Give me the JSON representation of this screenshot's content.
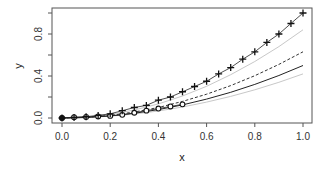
{
  "chart_data": {
    "type": "line",
    "title": "",
    "xlabel": "x",
    "ylabel": "y",
    "xlim": [
      0.0,
      1.0
    ],
    "ylim": [
      0.0,
      1.0
    ],
    "grid": false,
    "legend": null,
    "x_ticks": [
      0.0,
      0.2,
      0.4,
      0.6,
      0.8,
      1.0
    ],
    "x_tick_labels": [
      "0.0",
      "0.2",
      "0.4",
      "0.6",
      "0.8",
      "1.0"
    ],
    "y_ticks": [
      0.0,
      0.2,
      0.4,
      0.6,
      0.8,
      1.0
    ],
    "y_tick_labels": [
      "0.0",
      "",
      "0.4",
      "",
      "0.8",
      ""
    ],
    "series": [
      {
        "name": "plus-points",
        "style": "markers+line",
        "marker": "plus",
        "color": "#222222",
        "x": [
          0.0,
          0.05,
          0.1,
          0.15,
          0.2,
          0.25,
          0.3,
          0.35,
          0.4,
          0.45,
          0.5,
          0.55,
          0.6,
          0.65,
          0.7,
          0.75,
          0.8,
          0.85,
          0.9,
          0.95,
          1.0
        ],
        "y": [
          0.0,
          0.005,
          0.012,
          0.025,
          0.04,
          0.07,
          0.1,
          0.12,
          0.17,
          0.2,
          0.25,
          0.3,
          0.35,
          0.42,
          0.48,
          0.56,
          0.63,
          0.72,
          0.8,
          0.9,
          1.0
        ]
      },
      {
        "name": "circle-points",
        "style": "markers+line",
        "marker": "circle",
        "color": "#222222",
        "x": [
          0.0,
          0.05,
          0.1,
          0.15,
          0.2,
          0.25,
          0.3,
          0.35,
          0.4,
          0.45,
          0.5
        ],
        "y": [
          0.0,
          0.008,
          0.01,
          0.015,
          0.02,
          0.03,
          0.05,
          0.07,
          0.09,
          0.11,
          0.13
        ]
      },
      {
        "name": "solid-fit",
        "style": "solid",
        "color": "#222222",
        "x": [
          0.0,
          0.1,
          0.2,
          0.3,
          0.4,
          0.5,
          0.6,
          0.7,
          0.8,
          0.9,
          1.0
        ],
        "y": [
          0.0,
          0.005,
          0.02,
          0.045,
          0.08,
          0.125,
          0.18,
          0.245,
          0.32,
          0.405,
          0.5
        ]
      },
      {
        "name": "dashed-fit",
        "style": "dashed",
        "color": "#333333",
        "x": [
          0.0,
          0.1,
          0.2,
          0.3,
          0.4,
          0.5,
          0.6,
          0.7,
          0.8,
          0.9,
          1.0
        ],
        "y": [
          0.0,
          0.006,
          0.025,
          0.057,
          0.1,
          0.158,
          0.227,
          0.309,
          0.403,
          0.51,
          0.63
        ]
      },
      {
        "name": "upper-band",
        "style": "solid",
        "color": "#c8c8c8",
        "x": [
          0.0,
          0.1,
          0.2,
          0.3,
          0.4,
          0.5,
          0.6,
          0.7,
          0.8,
          0.9,
          1.0
        ],
        "y": [
          0.0,
          0.008,
          0.034,
          0.076,
          0.134,
          0.21,
          0.302,
          0.412,
          0.538,
          0.68,
          0.84
        ]
      },
      {
        "name": "lower-band",
        "style": "solid",
        "color": "#c8c8c8",
        "x": [
          0.0,
          0.1,
          0.2,
          0.3,
          0.4,
          0.5,
          0.6,
          0.7,
          0.8,
          0.9,
          1.0
        ],
        "y": [
          0.0,
          0.004,
          0.017,
          0.038,
          0.067,
          0.105,
          0.151,
          0.206,
          0.269,
          0.34,
          0.42
        ]
      }
    ]
  }
}
